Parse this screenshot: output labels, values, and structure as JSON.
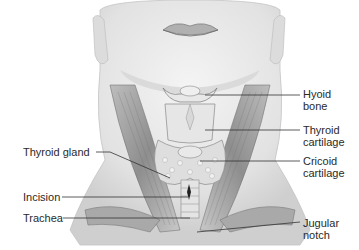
{
  "diagram": {
    "labels_right": [
      {
        "id": "hyoid-bone",
        "line1": "Hyoid",
        "line2": "bone"
      },
      {
        "id": "thyroid-cartilage",
        "line1": "Thyroid",
        "line2": "cartilage"
      },
      {
        "id": "cricoid-cartilage",
        "line1": "Cricoid",
        "line2": "cartilage"
      },
      {
        "id": "jugular-notch",
        "line1": "Jugular",
        "line2": "notch"
      }
    ],
    "labels_left": [
      {
        "id": "thyroid-gland",
        "text": "Thyroid gland"
      },
      {
        "id": "incision",
        "text": "Incision"
      },
      {
        "id": "trachea",
        "text": "Trachea"
      }
    ],
    "colors": {
      "background": "#ffffff",
      "text": "#2a2a2a",
      "leader_line": "#333333",
      "skin_shade": "#d9d9d9",
      "muscle": "#9a9a9a"
    }
  }
}
